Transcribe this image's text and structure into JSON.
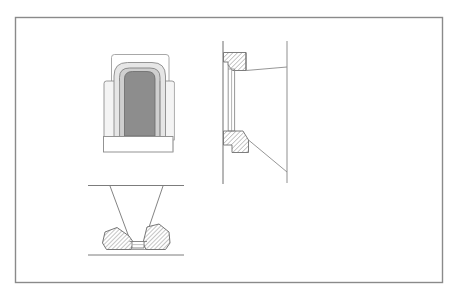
{
  "document": {
    "type": "technical-engineering-drawing",
    "title": "Technical Drawing Plate",
    "background_color": "#ffffff",
    "canvas": {
      "width": 459,
      "height": 300
    }
  },
  "frame": {
    "name": "drawing-border",
    "x": 15,
    "y": 17,
    "width": 428,
    "height": 266,
    "stroke_color": "#8a8a8a",
    "stroke_width": 1.4,
    "fill": "none"
  },
  "palette": {
    "line_dark": "#5a5a5a",
    "line_medium": "#7c7c7c",
    "line_light": "#a8a8a8",
    "fill_white": "#ffffff",
    "fill_pale": "#f2f2f2",
    "fill_light_gray": "#e3e3e3",
    "fill_mid_gray": "#c9c9c9",
    "fill_dark_gray": "#8a8a8a",
    "hatch_stroke": "#6f6f6f"
  },
  "views": [
    {
      "id": "front-elevation",
      "label": "Front elevation with arched opening",
      "position": {
        "x": 98,
        "y": 46,
        "width": 86,
        "height": 110
      },
      "elements": [
        {
          "name": "outer-cap-plate",
          "shape": "rounded-rect",
          "fill": "#ffffff",
          "stroke": "#9a9a9a"
        },
        {
          "name": "upper-body-block",
          "shape": "rounded-rect",
          "fill": "#f2f2f2",
          "stroke": "#8e8e8e"
        },
        {
          "name": "lower-body-block",
          "shape": "rounded-rect",
          "fill": "#efefef",
          "stroke": "#8a8a8a"
        },
        {
          "name": "arch-outer-band",
          "shape": "arch",
          "fill": "#e3e3e3",
          "stroke": "#8a8a8a"
        },
        {
          "name": "arch-inner-band",
          "shape": "arch",
          "fill": "#c9c9c9",
          "stroke": "#7c7c7c"
        },
        {
          "name": "arch-opening-core",
          "shape": "arch",
          "fill": "#8a8a8a",
          "stroke": "#6a6a6a"
        },
        {
          "name": "base-plate",
          "shape": "rect",
          "fill": "#ffffff",
          "stroke": "#8e8e8e"
        },
        {
          "name": "left-jamb-line",
          "shape": "line",
          "stroke": "#9a9a9a"
        },
        {
          "name": "right-jamb-line",
          "shape": "line",
          "stroke": "#9a9a9a"
        }
      ]
    },
    {
      "id": "vertical-section",
      "label": "Vertical cross-section through flange joint",
      "position": {
        "x": 214,
        "y": 38,
        "width": 80,
        "height": 150
      },
      "elements": [
        {
          "name": "left-wall-line",
          "shape": "line",
          "stroke": "#6f6f6f"
        },
        {
          "name": "right-wall-line",
          "shape": "line",
          "stroke": "#8a8a8a"
        },
        {
          "name": "upper-hatched-seal",
          "shape": "polygon-hatched",
          "fill": "#ffffff",
          "stroke": "#6f6f6f",
          "hatch": "diagonal-45"
        },
        {
          "name": "lower-hatched-seal",
          "shape": "polygon-hatched",
          "fill": "#ffffff",
          "stroke": "#6f6f6f",
          "hatch": "diagonal-45"
        },
        {
          "name": "inner-channel-left",
          "shape": "line",
          "stroke": "#8a8a8a"
        },
        {
          "name": "inner-channel-right",
          "shape": "line",
          "stroke": "#8a8a8a"
        },
        {
          "name": "upper-taper-line",
          "shape": "line",
          "stroke": "#8a8a8a"
        },
        {
          "name": "lower-taper-line",
          "shape": "line",
          "stroke": "#8a8a8a"
        }
      ]
    },
    {
      "id": "funnel-section",
      "label": "Sectional view of tapered funnel seating",
      "position": {
        "x": 86,
        "y": 182,
        "width": 100,
        "height": 78
      },
      "elements": [
        {
          "name": "top-reference-line",
          "shape": "line",
          "stroke": "#7c7c7c"
        },
        {
          "name": "bottom-reference-line",
          "shape": "line",
          "stroke": "#7c7c7c"
        },
        {
          "name": "funnel-left-wall",
          "shape": "line",
          "stroke": "#7c7c7c"
        },
        {
          "name": "funnel-right-wall",
          "shape": "line",
          "stroke": "#7c7c7c"
        },
        {
          "name": "left-hatched-block",
          "shape": "polygon-hatched",
          "fill": "#ffffff",
          "stroke": "#6f6f6f",
          "hatch": "diagonal-45"
        },
        {
          "name": "right-hatched-block",
          "shape": "polygon-hatched",
          "fill": "#ffffff",
          "stroke": "#6f6f6f",
          "hatch": "diagonal-45"
        },
        {
          "name": "throat-channel",
          "shape": "polygon",
          "fill": "#ffffff",
          "stroke": "#7c7c7c"
        },
        {
          "name": "throat-inner-line",
          "shape": "line",
          "stroke": "#9a9a9a"
        }
      ]
    }
  ]
}
